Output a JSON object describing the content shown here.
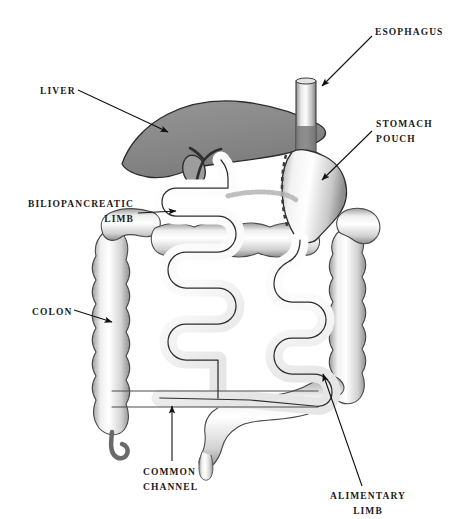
{
  "figure": {
    "background_color": "#ffffff",
    "width": 462,
    "height": 519
  },
  "labels": {
    "esophagus": "ESOPHAGUS",
    "liver": "LIVER",
    "stomach_pouch_line1": "STOMACH",
    "stomach_pouch_line2": "POUCH",
    "biliopancreatic_line1": "BILIOPANCREATIC",
    "biliopancreatic_line2": "LIMB",
    "colon": "COLON",
    "common_channel_line1": "COMMON",
    "common_channel_line2": "CHANNEL",
    "alimentary_line1": "ALIMENTARY",
    "alimentary_line2": "LIMB"
  },
  "colors": {
    "text": "#1a1a1a",
    "liver_fill": "#8a8a8a",
    "liver_stroke": "#2b2b2b",
    "organ_fill": "#fbfbfb",
    "organ_stroke": "#2e2e2e",
    "shadow": "#9a9a9a",
    "leader_line": "#111111",
    "staple_line": "#3a3a3a"
  },
  "parts": [
    {
      "name": "esophagus",
      "description": "vertical tube entering from top into stomach pouch"
    },
    {
      "name": "liver",
      "description": "large gray wedge-shaped organ overlying stomach"
    },
    {
      "name": "gallbladder-and-bile-duct",
      "description": "oval gallbladder with Y-shaped duct under liver"
    },
    {
      "name": "stomach-pouch",
      "description": "sleeve-shaped gastric pouch with vertical dashed staple line"
    },
    {
      "name": "biliopancreatic-limb",
      "description": "left serpentine small-bowel limb"
    },
    {
      "name": "alimentary-limb",
      "description": "right serpentine small-bowel limb"
    },
    {
      "name": "common-channel",
      "description": "horizontal distal small-bowel segment at bottom"
    },
    {
      "name": "colon",
      "description": "haustrated large bowel framing the small intestine"
    },
    {
      "name": "appendix",
      "description": "small hook at lower left of colon"
    },
    {
      "name": "sigmoid-colon",
      "description": "haustrated segment descending at bottom center-right"
    }
  ]
}
